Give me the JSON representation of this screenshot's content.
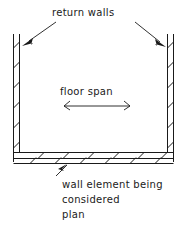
{
  "figure": {
    "type": "architectural-plan-diagram",
    "title": "plan",
    "background_color": "#ffffff",
    "line_color": "#1a1a1a",
    "text_color": "#1a1a1a"
  },
  "labels": {
    "return_walls": "return walls",
    "floor_span": "floor  span",
    "wall_element_line1": "wall element  being",
    "wall_element_line2": "considered",
    "plan": "plan"
  },
  "annotations": {
    "return_walls_label": "return walls",
    "floor_span_label": "floor  span",
    "wall_element_label": "wall element  being considered",
    "plan_label": "plan"
  },
  "elements": {
    "left_return_wall": "left-return-wall",
    "right_return_wall": "right-return-wall",
    "bottom_wall_element": "bottom-wall-element",
    "floor_span_arrow": "floor-span-double-arrow",
    "left_leader_arrow": "left-return-wall-leader-arrow",
    "right_leader_arrow": "right-return-wall-leader-arrow",
    "wall_element_leader": "wall-element-leader-line"
  }
}
